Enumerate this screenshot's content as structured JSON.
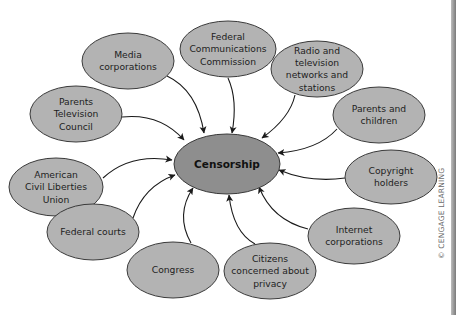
{
  "center": {
    "label": "Censorship",
    "cx": 227,
    "cy": 164,
    "rx": 53,
    "ry": 30
  },
  "nodes": [
    {
      "id": "media-corporations",
      "lines": [
        "Media",
        "corporations"
      ],
      "cx": 128,
      "cy": 61,
      "rx": 46,
      "ry": 28
    },
    {
      "id": "fcc",
      "lines": [
        "Federal",
        "Communications",
        "Commission"
      ],
      "cx": 228,
      "cy": 49,
      "rx": 48,
      "ry": 28
    },
    {
      "id": "radio-tv",
      "lines": [
        "Radio and",
        "television",
        "networks and",
        "stations"
      ],
      "cx": 317,
      "cy": 69,
      "rx": 46,
      "ry": 28
    },
    {
      "id": "parents-children",
      "lines": [
        "Parents and",
        "children"
      ],
      "cx": 379,
      "cy": 115,
      "rx": 46,
      "ry": 28
    },
    {
      "id": "parents-tv-council",
      "lines": [
        "Parents",
        "Television",
        "Council"
      ],
      "cx": 76,
      "cy": 114,
      "rx": 46,
      "ry": 28
    },
    {
      "id": "aclu",
      "lines": [
        "American",
        "Civil Liberties",
        "Union"
      ],
      "cx": 56,
      "cy": 187,
      "rx": 47,
      "ry": 29
    },
    {
      "id": "copyright-holders",
      "lines": [
        "Copyright",
        "holders"
      ],
      "cx": 391,
      "cy": 177,
      "rx": 46,
      "ry": 27
    },
    {
      "id": "federal-courts",
      "lines": [
        "Federal courts"
      ],
      "cx": 93,
      "cy": 232,
      "rx": 46,
      "ry": 28
    },
    {
      "id": "internet-corporations",
      "lines": [
        "Internet",
        "corporations"
      ],
      "cx": 354,
      "cy": 236,
      "rx": 46,
      "ry": 28
    },
    {
      "id": "congress",
      "lines": [
        "Congress"
      ],
      "cx": 173,
      "cy": 270,
      "rx": 46,
      "ry": 28
    },
    {
      "id": "citizens-privacy",
      "lines": [
        "Citizens",
        "concerned about",
        "privacy"
      ],
      "cx": 270,
      "cy": 271,
      "rx": 46,
      "ry": 28
    }
  ],
  "arrows": [
    {
      "from": "media-corporations",
      "d": "M 167 76 Q 197 90 204 133"
    },
    {
      "from": "fcc",
      "d": "M 228 78 Q 238 100 232 133"
    },
    {
      "from": "radio-tv",
      "d": "M 295 95 Q 290 118 262 138"
    },
    {
      "from": "parents-children",
      "d": "M 337 129 Q 318 150 278 153"
    },
    {
      "from": "parents-tv-council",
      "d": "M 122 117 Q 160 113 184 140"
    },
    {
      "from": "aclu",
      "d": "M 103 178 Q 130 153 172 160"
    },
    {
      "from": "copyright-holders",
      "d": "M 345 178 Q 310 183 279 170"
    },
    {
      "from": "federal-courts",
      "d": "M 133 218 Q 144 186 175 175"
    },
    {
      "from": "internet-corporations",
      "d": "M 308 229 Q 272 220 259 187"
    },
    {
      "from": "congress",
      "d": "M 191 243 Q 175 215 193 188"
    },
    {
      "from": "citizens-privacy",
      "d": "M 255 244 Q 233 232 229 195"
    }
  ],
  "credit": "© CENGAGE LEARNING",
  "colors": {
    "node_fill": "#b3b3b3",
    "center_fill": "#8e8e8e",
    "stroke": "#3a3a3a",
    "text": "#1e1e1e"
  }
}
